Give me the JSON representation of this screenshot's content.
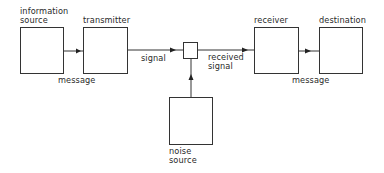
{
  "diagram": {
    "type": "block-diagram",
    "title": "",
    "nodes": [
      {
        "id": "information_source",
        "label_line1": "information",
        "label_line2": "source"
      },
      {
        "id": "transmitter",
        "label_line1": "transmitter"
      },
      {
        "id": "mixer",
        "label_line1": ""
      },
      {
        "id": "receiver",
        "label_line1": "receiver"
      },
      {
        "id": "destination",
        "label_line1": "destination"
      },
      {
        "id": "noise_source",
        "label_line1": "noise",
        "label_line2": "source"
      }
    ],
    "edges": [
      {
        "from": "information_source",
        "to": "transmitter",
        "label": "message"
      },
      {
        "from": "transmitter",
        "to": "mixer",
        "label": "signal"
      },
      {
        "from": "mixer",
        "to": "receiver",
        "label_line1": "received",
        "label_line2": "signal"
      },
      {
        "from": "receiver",
        "to": "destination",
        "label": "message"
      },
      {
        "from": "noise_source",
        "to": "mixer",
        "label": ""
      }
    ],
    "colors": {
      "stroke": "#333333",
      "text": "#2a2a2a",
      "background": "#ffffff"
    }
  }
}
